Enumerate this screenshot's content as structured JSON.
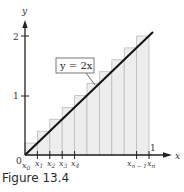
{
  "figure": {
    "caption": "Figure 13.4",
    "equation_label": "y = 2x",
    "axes": {
      "x_label": "x",
      "y_label": "y",
      "origin_label": "0",
      "y_ticks": [
        {
          "value": 1,
          "label": "1"
        },
        {
          "value": 2,
          "label": "2"
        }
      ],
      "x_end_tick_label": "1"
    },
    "x_partition_labels": [
      {
        "base": "x",
        "sub": "0"
      },
      {
        "base": "x",
        "sub": "1"
      },
      {
        "base": "x",
        "sub": "2"
      },
      {
        "base": "x",
        "sub": "3"
      },
      {
        "base": "x",
        "sub": "4"
      },
      {
        "base": "x",
        "sub": "n − 1"
      },
      {
        "base": "x",
        "sub": "n"
      }
    ],
    "colors": {
      "bar_fill": "#ededed",
      "bar_stroke": "#bdbdbd",
      "line": "#111111",
      "axis": "#222222"
    }
  },
  "chart_data": {
    "type": "bar",
    "title": "Figure 13.4",
    "function": "y = 2x",
    "xlim": [
      0,
      1
    ],
    "ylim": [
      0,
      2
    ],
    "n": 10,
    "x": [
      0.1,
      0.2,
      0.3,
      0.4,
      0.5,
      0.6,
      0.7,
      0.8,
      0.9,
      1.0
    ],
    "values": [
      0.2,
      0.4,
      0.6,
      0.8,
      1.0,
      1.2,
      1.4,
      1.6,
      1.8,
      2.0
    ],
    "xlabel": "x",
    "ylabel": "y",
    "grid": false
  }
}
